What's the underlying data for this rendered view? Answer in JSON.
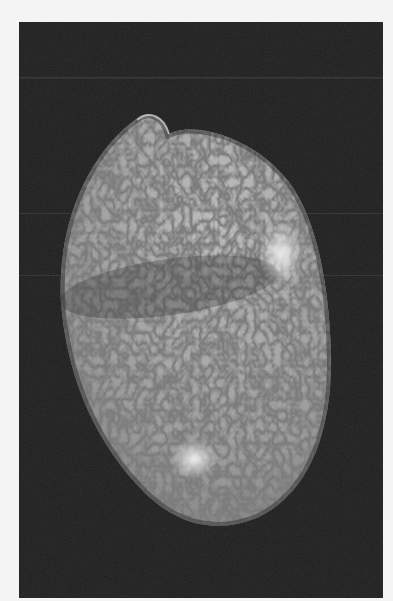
{
  "image": {
    "subject": "shell photograph",
    "description": "Grayscale photo of a speckled oval sea shell on a dark background",
    "background_color": "#1e1e1e",
    "frame_color": "#f4f4f4",
    "shell_base_color": "#9a9a9a",
    "speckle_color": "#4a4a4a",
    "highlight_color": "#e8e8e8"
  }
}
